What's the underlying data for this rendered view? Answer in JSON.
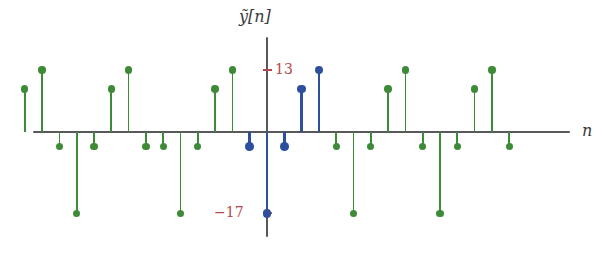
{
  "chart_data": {
    "type": "stem",
    "title": "",
    "subtitle": "",
    "xlabel": "n",
    "ylabel": "ỹ[n]",
    "grid": false,
    "legend": null,
    "axis": {
      "x_axis_visible": true,
      "y_axis_visible": true,
      "xlim": [
        -15.5,
        14.5
      ],
      "ylim": [
        -20,
        16
      ]
    },
    "tick_labels": {
      "y": [
        "13",
        "−17"
      ],
      "y_values": [
        13,
        -17
      ],
      "x": []
    },
    "series": [
      {
        "name": "periodic-extension",
        "color": "#3d8b37",
        "marker": "filled-circle",
        "x": [
          -14,
          -13,
          -12,
          -11,
          -10,
          -9,
          -8,
          -7,
          -6,
          -5,
          -4,
          -3,
          -2
        ],
        "values": [
          9,
          13,
          -3,
          -17,
          -3,
          9,
          13,
          -3,
          -3,
          -17,
          -3,
          9,
          13
        ]
      },
      {
        "name": "one-period",
        "color": "#2d4f9e",
        "marker": "filled-circle",
        "x": [
          -1,
          0,
          1,
          2,
          3
        ],
        "values": [
          -3,
          -17,
          -3,
          9,
          13
        ]
      },
      {
        "name": "periodic-extension-right",
        "color": "#3d8b37",
        "marker": "filled-circle",
        "x": [
          4,
          5,
          6,
          7,
          8,
          9,
          10,
          11,
          12,
          13,
          14
        ],
        "values": [
          -3,
          -17,
          -3,
          9,
          13,
          -3,
          -17,
          -3,
          9,
          13,
          -3
        ]
      }
    ]
  },
  "colors": {
    "green": "#3d8b37",
    "blue": "#2d4f9e",
    "axis": "#58585a",
    "tick_red": "#b2494b",
    "background": "#ffffff"
  }
}
